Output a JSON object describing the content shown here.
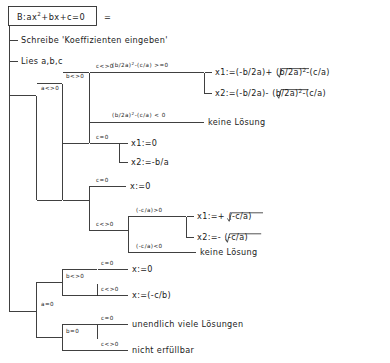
{
  "diagram": {
    "kind": "decision-tree",
    "language": "de",
    "header": {
      "box_label": "B:ax²+bx+c=0",
      "box_label_base": "B:ax",
      "box_label_sup": "2",
      "box_label_rest": "+bx+c=0",
      "equals_sign": "="
    },
    "statements": [
      {
        "id": "stmt-schreibe",
        "text": "Schreibe 'Koeffizienten eingeben'"
      },
      {
        "id": "stmt-lies",
        "text": "Lies a,b,c"
      }
    ],
    "conditions": {
      "a_ne_0": "a<>0",
      "a_eq_0": "a=0",
      "b_ne_0": "b<>0",
      "b_eq_0": "b=0",
      "c_ne_0": "c<>0",
      "c_eq_0": "c=0",
      "disc_ge_0_base": "(b/2a)",
      "disc_ge_0_sup": "2",
      "disc_ge_0_rest": "-(c/a)  >=0",
      "disc_lt_0_base": "(b/2a)",
      "disc_lt_0_sup": "2",
      "disc_lt_0_rest": "-(c/a)  <  0",
      "neg_ca_gt_0": "(-c/a)>0",
      "neg_ca_lt_0": "(-c/a)<0"
    },
    "actions": {
      "x1_quad_plus_head": "x1:=(-b/2a)+",
      "x1_quad_rad_base": "(b/2a)",
      "x1_quad_rad_sup": "2",
      "x1_quad_rad_rest": "-(c/a)",
      "x2_quad_minus_head": "x2:=(-b/2a)-",
      "x2_quad_rad_base": "(b/2a)",
      "x2_quad_rad_sup": "2",
      "x2_quad_rad_rest": "-(c/a)",
      "keine_loesung_1": "keine Lösung",
      "x1_zero": "x1:=0",
      "x2_minus_b_a": "x2:=-b/a",
      "x_zero_a": "x:=0",
      "x1_sqrt_plus_head": "x1:=+",
      "x1_sqrt_rad": "(-c/a)",
      "x2_sqrt_minus_head": "x2:=-",
      "x2_sqrt_rad": "(-c/a)",
      "keine_loesung_2": "keine Lösung",
      "x_zero_b": "x:=0",
      "x_minus_c_b": "x:=(-c/b)",
      "unendlich": "unendlich viele Lösungen",
      "nicht_erfuellbar": "nicht erfüllbar"
    },
    "colors": {
      "line": "#2b2b2b",
      "text": "#1a1a1a",
      "background": "#ffffff"
    }
  }
}
